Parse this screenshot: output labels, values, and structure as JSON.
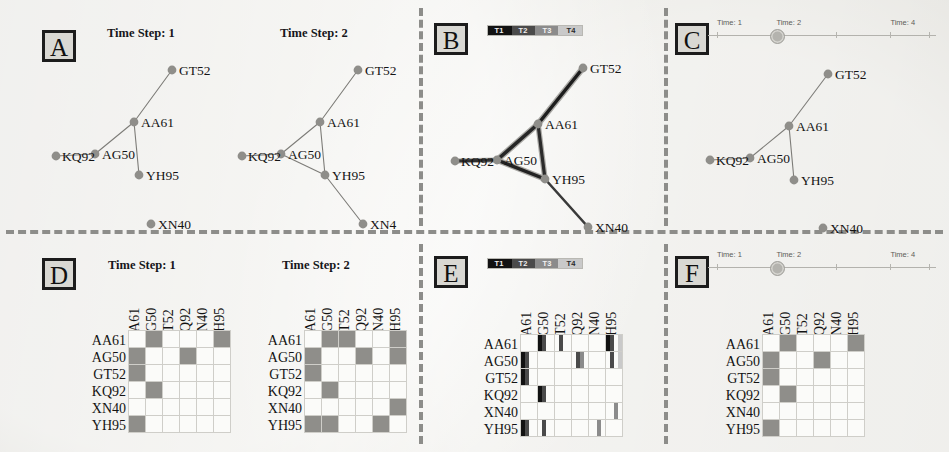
{
  "figure": {
    "background_color": "#ecebe6",
    "node_color": "#8f8e8a",
    "edge_color": "#7d7c78",
    "separator_style": "dashed"
  },
  "entities": [
    "AA61",
    "AG50",
    "GT52",
    "KQ92",
    "XN40",
    "YH95"
  ],
  "panels": [
    {
      "id": "A",
      "letter": "A",
      "technique": "small-multiples",
      "row": "node-link",
      "titles": [
        "Time Step: 1",
        "Time Step: 2"
      ]
    },
    {
      "id": "B",
      "letter": "B",
      "technique": "superimposed",
      "row": "node-link",
      "titles": []
    },
    {
      "id": "C",
      "letter": "C",
      "technique": "animation",
      "row": "node-link",
      "titles": []
    },
    {
      "id": "D",
      "letter": "D",
      "technique": "small-multiples",
      "row": "matrix",
      "titles": [
        "Time Step: 1",
        "Time Step: 2"
      ]
    },
    {
      "id": "E",
      "letter": "E",
      "technique": "superimposed",
      "row": "matrix",
      "titles": []
    },
    {
      "id": "F",
      "letter": "F",
      "technique": "animation",
      "row": "matrix",
      "titles": []
    }
  ],
  "colorbar": {
    "labels": [
      "T1",
      "T2",
      "T3",
      "T4"
    ],
    "colors": [
      "#121212",
      "#4a4a4a",
      "#8b8b8b",
      "#c9c9c9"
    ],
    "orientation": "horizontal"
  },
  "slider": {
    "labels": [
      "Time: 1",
      "Time: 2",
      "Time: 4"
    ],
    "label_positions_pct": [
      4,
      30,
      80
    ],
    "tick_positions_pct": [
      4,
      30,
      56,
      80,
      97
    ],
    "knob_position_pct": 30,
    "current_value": 2,
    "min": 1,
    "max": 4
  },
  "networks": {
    "timestep1": {
      "label": "Time Step: 1",
      "nodes": [
        {
          "id": "GT52",
          "x": 126,
          "y": 22,
          "label_dx": 7,
          "label_dy": -7
        },
        {
          "id": "AA61",
          "x": 88,
          "y": 74,
          "label_dx": 7,
          "label_dy": -7
        },
        {
          "id": "AG50",
          "x": 49,
          "y": 106,
          "label_dx": 7,
          "label_dy": -7
        },
        {
          "id": "KQ92",
          "x": 10,
          "y": 108,
          "label_dx": 6,
          "label_dy": -7
        },
        {
          "id": "YH95",
          "x": 93,
          "y": 127,
          "label_dx": 7,
          "label_dy": -7
        },
        {
          "id": "XN40",
          "x": 105,
          "y": 176,
          "label_dx": 7,
          "label_dy": -7
        }
      ],
      "edges": [
        [
          "GT52",
          "AA61"
        ],
        [
          "AA61",
          "AG50"
        ],
        [
          "AA61",
          "YH95"
        ],
        [
          "AG50",
          "KQ92"
        ]
      ]
    },
    "timestep2": {
      "label": "Time Step: 2",
      "nodes": [
        {
          "id": "GT52",
          "x": 126,
          "y": 22,
          "label_dx": 7,
          "label_dy": -7
        },
        {
          "id": "AA61",
          "x": 88,
          "y": 74,
          "label_dx": 7,
          "label_dy": -7
        },
        {
          "id": "AG50",
          "x": 49,
          "y": 106,
          "label_dx": 7,
          "label_dy": -7
        },
        {
          "id": "KQ92",
          "x": 10,
          "y": 108,
          "label_dx": 6,
          "label_dy": -7
        },
        {
          "id": "YH95",
          "x": 93,
          "y": 127,
          "label_dx": 7,
          "label_dy": -7
        },
        {
          "id": "XN4",
          "x": 131,
          "y": 176,
          "label_dx": 7,
          "label_dy": -7
        }
      ],
      "edges": [
        [
          "GT52",
          "AA61"
        ],
        [
          "AA61",
          "AG50"
        ],
        [
          "AA61",
          "YH95"
        ],
        [
          "AG50",
          "YH95"
        ],
        [
          "AG50",
          "KQ92"
        ],
        [
          "YH95",
          "XN4"
        ]
      ]
    },
    "superimposed": {
      "label": "",
      "nodes": [
        {
          "id": "GT52",
          "x": 136,
          "y": 20,
          "label_dx": 7,
          "label_dy": -7
        },
        {
          "id": "AA61",
          "x": 91,
          "y": 76,
          "label_dx": 7,
          "label_dy": -7
        },
        {
          "id": "AG50",
          "x": 50,
          "y": 112,
          "label_dx": 7,
          "label_dy": -7
        },
        {
          "id": "KQ92",
          "x": 8,
          "y": 113,
          "label_dx": 6,
          "label_dy": -7
        },
        {
          "id": "YH95",
          "x": 98,
          "y": 131,
          "label_dx": 7,
          "label_dy": -7
        },
        {
          "id": "XN40",
          "x": 141,
          "y": 179,
          "label_dx": 7,
          "label_dy": -7
        }
      ],
      "edges": [
        [
          "GT52",
          "AA61",
          3.4,
          "#1d1d1d"
        ],
        [
          "AA61",
          "AG50",
          3.6,
          "#262626"
        ],
        [
          "AA61",
          "YH95",
          3.2,
          "#2b2b2b"
        ],
        [
          "AG50",
          "YH95",
          3.4,
          "#222222"
        ],
        [
          "AG50",
          "KQ92",
          3.0,
          "#303030"
        ],
        [
          "YH95",
          "XN40",
          2.6,
          "#3a3a3a"
        ],
        [
          "GT52",
          "AA61",
          6.0,
          "#a9a8a4"
        ],
        [
          "AA61",
          "AG50",
          6.2,
          "#a9a8a4"
        ],
        [
          "AA61",
          "YH95",
          5.6,
          "#aaa9a5"
        ],
        [
          "AG50",
          "YH95",
          5.8,
          "#a9a8a4"
        ],
        [
          "AG50",
          "KQ92",
          5.2,
          "#adaca8"
        ]
      ]
    },
    "animation": {
      "label": "",
      "nodes": [
        {
          "id": "GT52",
          "x": 128,
          "y": 24,
          "label_dx": 7,
          "label_dy": -7
        },
        {
          "id": "AA61",
          "x": 89,
          "y": 76,
          "label_dx": 7,
          "label_dy": -7
        },
        {
          "id": "AG50",
          "x": 50,
          "y": 108,
          "label_dx": 7,
          "label_dy": -7
        },
        {
          "id": "KQ92",
          "x": 10,
          "y": 110,
          "label_dx": 6,
          "label_dy": -7
        },
        {
          "id": "YH95",
          "x": 94,
          "y": 130,
          "label_dx": 7,
          "label_dy": -7
        },
        {
          "id": "XN40",
          "x": 123,
          "y": 178,
          "label_dx": 7,
          "label_dy": -7
        }
      ],
      "edges": [
        [
          "GT52",
          "AA61"
        ],
        [
          "AA61",
          "AG50"
        ],
        [
          "AA61",
          "YH95"
        ],
        [
          "AG50",
          "KQ92"
        ]
      ]
    }
  },
  "matrices": {
    "labels": [
      "AA61",
      "AG50",
      "GT52",
      "KQ92",
      "XN40",
      "YH95"
    ],
    "timestep1": {
      "label": "Time Step: 1",
      "cells": [
        [
          0,
          1,
          0,
          0,
          0,
          1
        ],
        [
          1,
          0,
          0,
          1,
          0,
          0
        ],
        [
          1,
          0,
          0,
          0,
          0,
          0
        ],
        [
          0,
          1,
          0,
          0,
          0,
          0
        ],
        [
          0,
          0,
          0,
          0,
          0,
          0
        ],
        [
          1,
          0,
          0,
          0,
          0,
          0
        ]
      ]
    },
    "timestep2": {
      "label": "Time Step: 2",
      "cells": [
        [
          0,
          1,
          1,
          0,
          0,
          1
        ],
        [
          1,
          0,
          0,
          1,
          0,
          1
        ],
        [
          1,
          0,
          0,
          0,
          0,
          0
        ],
        [
          0,
          1,
          0,
          0,
          0,
          0
        ],
        [
          0,
          0,
          0,
          0,
          0,
          1
        ],
        [
          1,
          1,
          0,
          0,
          1,
          0
        ]
      ]
    },
    "superimposed": {
      "label": "",
      "cells": [
        [
          [],
          [
            1,
            2
          ],
          [
            2
          ],
          [],
          [],
          [
            1,
            2,
            4
          ]
        ],
        [
          [
            1,
            2
          ],
          [],
          [],
          [
            2,
            3
          ],
          [],
          [
            2,
            4
          ]
        ],
        [
          [
            1,
            2
          ],
          [],
          [],
          [],
          [],
          []
        ],
        [
          [],
          [
            1,
            2
          ],
          [],
          [],
          [],
          []
        ],
        [
          [],
          [],
          [],
          [],
          [],
          [
            3
          ]
        ],
        [
          [
            1,
            2
          ],
          [
            2
          ],
          [],
          [],
          [
            3
          ],
          []
        ]
      ]
    },
    "animation": {
      "label": "",
      "cells": [
        [
          0,
          1,
          0,
          0,
          0,
          1
        ],
        [
          1,
          0,
          0,
          1,
          0,
          0
        ],
        [
          1,
          0,
          0,
          0,
          0,
          0
        ],
        [
          0,
          1,
          0,
          0,
          0,
          0
        ],
        [
          0,
          0,
          0,
          0,
          0,
          0
        ],
        [
          1,
          0,
          0,
          0,
          0,
          0
        ]
      ]
    }
  }
}
